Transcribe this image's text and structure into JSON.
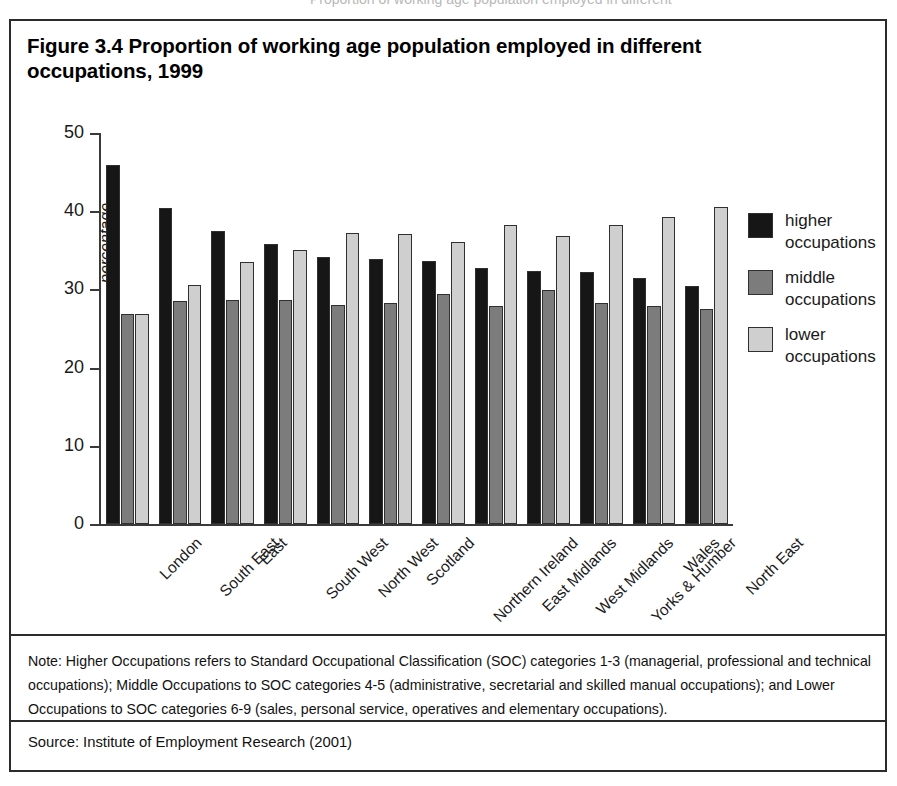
{
  "page": {
    "top_partial_text": "Proportion of working age population employed in different"
  },
  "figure": {
    "title": "Figure 3.4 Proportion of working age population employed in different occupations, 1999",
    "note": "Note: Higher Occupations refers to Standard Occupational Classification (SOC) categories 1-3 (managerial, professional and technical occupations); Middle Occupations to SOC categories 4-5 (administrative, secretarial and skilled manual occupations); and Lower Occupations to SOC categories 6-9 (sales, personal service, operatives and elementary occupations).",
    "source": "Source: Institute of Employment Research (2001)"
  },
  "colors": {
    "higher": "#161616",
    "middle": "#7c7c7c",
    "lower": "#cfcfcf",
    "axis": "#3a3a3a",
    "frame": "#2b2b2b",
    "background": "#ffffff"
  },
  "chart_data": {
    "type": "bar",
    "title": "Figure 3.4 Proportion of working age population employed in different occupations, 1999",
    "xlabel": "",
    "ylabel": "percentage",
    "ylim": [
      0,
      50
    ],
    "yticks": [
      0,
      10,
      20,
      30,
      40,
      50
    ],
    "ytick_labels": [
      "0",
      "10",
      "20",
      "30",
      "40",
      "50"
    ],
    "grid": false,
    "legend_position": "right",
    "categories": [
      "London",
      "South East",
      "East",
      "South West",
      "North West",
      "Scotland",
      "Northern Ireland",
      "East Midlands",
      "West Midlands",
      "Yorks & Humber",
      "Wales",
      "North East"
    ],
    "series": [
      {
        "name": "higher occupations",
        "color": "#161616",
        "values": [
          45.9,
          40.4,
          37.5,
          35.8,
          34.2,
          33.9,
          33.6,
          32.7,
          32.3,
          32.2,
          31.5,
          30.4
        ]
      },
      {
        "name": "middle occupations",
        "color": "#7c7c7c",
        "values": [
          26.8,
          28.5,
          28.6,
          28.7,
          28.0,
          28.2,
          29.4,
          27.9,
          29.9,
          28.3,
          27.9,
          27.5
        ]
      },
      {
        "name": "lower occupations",
        "color": "#cfcfcf",
        "values": [
          26.9,
          30.6,
          33.5,
          35.0,
          37.2,
          37.1,
          36.1,
          38.3,
          36.8,
          38.3,
          39.3,
          40.6
        ]
      }
    ]
  },
  "legend": {
    "items": [
      {
        "label": "higher\noccupations",
        "line1": "higher",
        "line2": "occupations",
        "color": "#161616"
      },
      {
        "label": "middle\noccupations",
        "line1": "middle",
        "line2": "occupations",
        "color": "#7c7c7c"
      },
      {
        "label": "lower\noccupations",
        "line1": "lower",
        "line2": "occupations",
        "color": "#cfcfcf"
      }
    ]
  }
}
